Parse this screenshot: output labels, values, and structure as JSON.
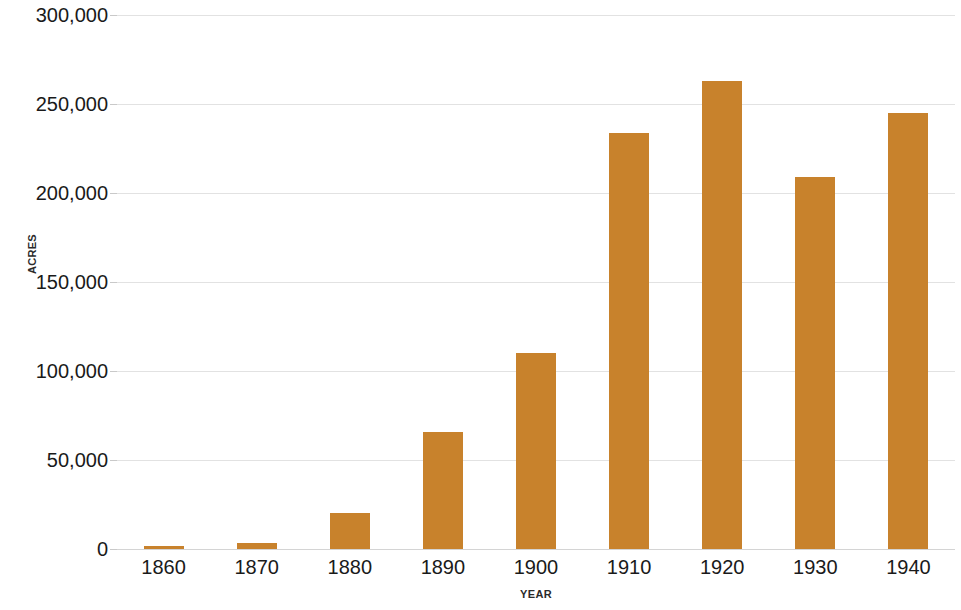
{
  "chart_data": {
    "type": "bar",
    "title": "",
    "xlabel": "YEAR",
    "ylabel": "ACRES",
    "categories": [
      "1860",
      "1870",
      "1880",
      "1890",
      "1900",
      "1910",
      "1920",
      "1930",
      "1940"
    ],
    "values": [
      1700,
      3500,
      20500,
      65500,
      110000,
      233500,
      263000,
      209000,
      245000
    ],
    "series": [
      {
        "name": "Acres",
        "values": [
          1700,
          3500,
          20500,
          65500,
          110000,
          233500,
          263000,
          209000,
          245000
        ]
      }
    ],
    "ylim": [
      0,
      300000
    ],
    "ytick_values": [
      0,
      50000,
      100000,
      150000,
      200000,
      250000,
      300000
    ],
    "ytick_labels": [
      "0",
      "50,000",
      "100,000",
      "150,000",
      "200,000",
      "250,000",
      "300,000"
    ],
    "grid": true,
    "legend": "none",
    "bar_color": "#c8822c",
    "gridline_color": "#e2e2e2",
    "background_color": "#ffffff",
    "text_color": "#1a1a1a"
  }
}
